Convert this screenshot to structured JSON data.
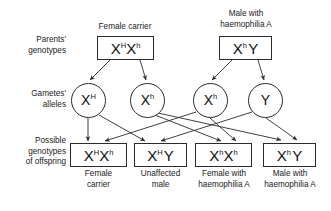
{
  "diagram": {
    "row_labels": [
      {
        "id": "parents",
        "line1": "Parents'",
        "line2": "genotypes"
      },
      {
        "id": "gametes",
        "line1": "Gametes'",
        "line2": "alleles"
      },
      {
        "id": "offspring",
        "line1": "Possible",
        "line2": "genotypes",
        "line3": "of offspring"
      }
    ],
    "parents": [
      {
        "id": "mother",
        "caption_line1": "Female carrier",
        "caption_line2": "",
        "allele1": "X",
        "allele1_sup": "H",
        "allele2": "X",
        "allele2_sup": "h"
      },
      {
        "id": "father",
        "caption_line1": "Male with",
        "caption_line2": "haemophilia A",
        "allele1": "X",
        "allele1_sup": "h",
        "allele2": "Y",
        "allele2_sup": ""
      }
    ],
    "gametes": [
      {
        "id": "gamete-xh-maternal-normal",
        "allele": "X",
        "sup": "H",
        "from": "mother"
      },
      {
        "id": "gamete-xh-maternal-affected",
        "allele": "X",
        "sup": "h",
        "from": "mother"
      },
      {
        "id": "gamete-xh-paternal",
        "allele": "X",
        "sup": "h",
        "from": "father"
      },
      {
        "id": "gamete-y-paternal",
        "allele": "Y",
        "sup": "",
        "from": "father"
      }
    ],
    "offspring": [
      {
        "id": "offspring-female-carrier",
        "allele1": "X",
        "allele1_sup": "H",
        "allele2": "X",
        "allele2_sup": "h",
        "caption_line1": "Female",
        "caption_line2": "carrier"
      },
      {
        "id": "offspring-unaffected-male",
        "allele1": "X",
        "allele1_sup": "H",
        "allele2": "Y",
        "allele2_sup": "",
        "caption_line1": "Unaffected",
        "caption_line2": "male"
      },
      {
        "id": "offspring-affected-female",
        "allele1": "X",
        "allele1_sup": "h",
        "allele2": "X",
        "allele2_sup": "h",
        "caption_line1": "Female with",
        "caption_line2": "haemophilia A"
      },
      {
        "id": "offspring-affected-male",
        "allele1": "X",
        "allele1_sup": "h",
        "allele2": "Y",
        "allele2_sup": "",
        "caption_line1": "Male with",
        "caption_line2": "haemophilia A"
      }
    ],
    "colors": {
      "stroke": "#2b2b2b",
      "text": "#1a1a1a",
      "background": "#ffffff"
    }
  }
}
